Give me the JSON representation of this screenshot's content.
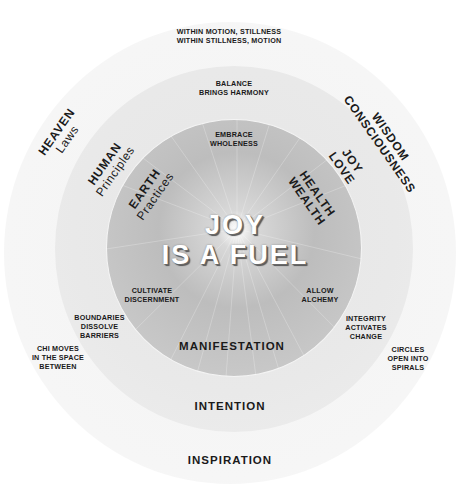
{
  "diagram": {
    "center_title": {
      "line1": "JOY",
      "line2": "IS A FUEL"
    },
    "rings": {
      "outer": {
        "label": "INSPIRATION",
        "color": "#f5f5f5"
      },
      "middle": {
        "label": "INTENTION",
        "color": "#e8e8e8"
      },
      "inner": {
        "label": "MANIFESTATION",
        "color": "#c4c4c4"
      }
    },
    "rotated_labels": {
      "heaven": {
        "title": "HEAVEN",
        "sub": "Laws"
      },
      "human": {
        "title": "HUMAN",
        "sub": "Principles"
      },
      "earth": {
        "title": "EARTH",
        "sub": "Practices"
      },
      "wisdom": {
        "title": "WISDOM",
        "sub": "CONSCIOUSNESS"
      },
      "joy": {
        "title": "JOY",
        "sub": "LOVE"
      },
      "health": {
        "title": "HEALTH",
        "sub": "WEALTH"
      }
    },
    "phrases": {
      "top_outer": {
        "line1": "WITHIN MOTION, STILLNESS",
        "line2": "WITHIN STILLNESS, MOTION"
      },
      "top_middle": {
        "line1": "BALANCE",
        "line2": "BRINGS HARMONY"
      },
      "top_inner": {
        "line1": "EMBRACE",
        "line2": "WHOLENESS"
      },
      "inner_left": {
        "line1": "CULTIVATE",
        "line2": "DISCERNMENT"
      },
      "inner_right": {
        "line1": "ALLOW",
        "line2": "ALCHEMY"
      },
      "middle_left": {
        "line1": "BOUNDARIES",
        "line2": "DISSOLVE",
        "line3": "BARRIERS"
      },
      "middle_right": {
        "line1": "INTEGRITY",
        "line2": "ACTIVATES",
        "line3": "CHANGE"
      },
      "outer_left": {
        "line1": "CHI MOVES",
        "line2": "IN THE SPACE",
        "line3": "BETWEEN"
      },
      "outer_right": {
        "line1": "CIRCLES",
        "line2": "OPEN INTO",
        "line3": "SPIRALS"
      }
    }
  }
}
